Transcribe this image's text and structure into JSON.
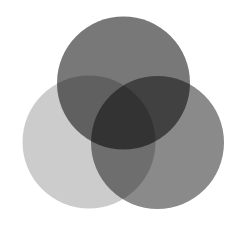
{
  "diagram": {
    "type": "venn-3",
    "background": "#ffffff",
    "circles": [
      {
        "id": "left",
        "cx": 89,
        "cy": 142,
        "r": 66.5,
        "fill": "#000000",
        "opacity": 0.2,
        "rendered_color": "#cccccc"
      },
      {
        "id": "right",
        "cx": 157.5,
        "cy": 142.5,
        "r": 66.5,
        "fill": "#000000",
        "opacity": 0.46,
        "rendered_color": "#8a8a8a"
      },
      {
        "id": "top",
        "cx": 123.5,
        "cy": 83,
        "r": 66.5,
        "fill": "#000000",
        "opacity": 0.53,
        "rendered_color": "#787878"
      }
    ],
    "overlap_colors": {
      "top_left": "#6e6e6e",
      "top_right": "#3a3a3a",
      "left_right": "#6a6a6a",
      "all_three": "#222222"
    }
  }
}
